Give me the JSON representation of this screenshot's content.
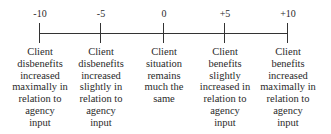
{
  "scale": {
    "points": [
      {
        "value": "-10",
        "x": 39,
        "lines": [
          "Client",
          "disbenefits",
          "increased",
          "maximally in",
          "relation to",
          "agency",
          "input"
        ]
      },
      {
        "value": "-5",
        "x": 100,
        "lines": [
          "Client",
          "disbenefits",
          "increased",
          "slightly in",
          "relation to",
          "agency",
          "input"
        ]
      },
      {
        "value": "0",
        "x": 163,
        "lines": [
          "Client",
          "situation",
          "remains",
          "much the",
          "same"
        ]
      },
      {
        "value": "+5",
        "x": 224,
        "lines": [
          "Client",
          "benefits",
          "slightly",
          "increased in",
          "relation to",
          "agency",
          "input"
        ]
      },
      {
        "value": "+10",
        "x": 287,
        "lines": [
          "Client",
          "benefits",
          "increased",
          "maximally in",
          "relation to",
          "agency",
          "input"
        ]
      }
    ]
  }
}
